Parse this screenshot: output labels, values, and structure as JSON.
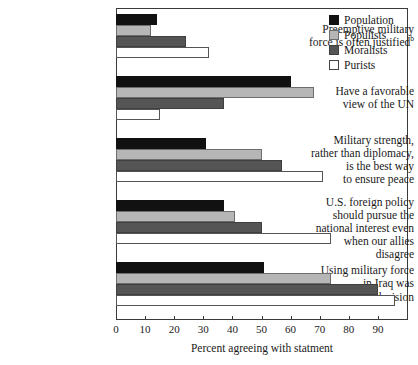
{
  "chart_data": {
    "type": "bar",
    "orientation": "horizontal",
    "title": "",
    "xlabel": "Percent agreeing with statment",
    "ylabel": "",
    "xlim": [
      0,
      100
    ],
    "xticks": [
      0,
      10,
      20,
      30,
      40,
      50,
      60,
      70,
      80,
      90
    ],
    "grid": false,
    "legend_position": "top-right",
    "categories": [
      "Preemptive military force is often justified",
      "Have a favorable view of the UN",
      "Military strength, rather than diplomacy, is the best way to ensure peace",
      "U.S. foreign policy should pursue the national interest even when our allies disagree",
      "Using military force in Iraq was right decision"
    ],
    "series": [
      {
        "name": "Population",
        "color": "#111111",
        "values": [
          14,
          60,
          31,
          37,
          51
        ]
      },
      {
        "name": "Populists",
        "color": "#b6b6b6",
        "values": [
          12,
          68,
          50,
          41,
          74
        ]
      },
      {
        "name": "Moralists",
        "color": "#555555",
        "values": [
          24,
          37,
          57,
          50,
          90
        ]
      },
      {
        "name": "Purists",
        "color": "#ffffff",
        "values": [
          32,
          15,
          71,
          74,
          96
        ]
      }
    ]
  },
  "categories_display": [
    {
      "lines": [
        "Preemptive military",
        "force is often justified"
      ],
      "footnote": "b"
    },
    {
      "lines": [
        "Have a favorable",
        "view of the UN"
      ],
      "footnote": ""
    },
    {
      "lines": [
        "Military strength,",
        "rather than diplomacy,",
        "is the best way",
        "to ensure peace"
      ],
      "footnote": ""
    },
    {
      "lines": [
        "U.S. foreign policy",
        "should pursue the",
        "national interest even",
        "when our allies disagree"
      ],
      "footnote": ""
    },
    {
      "lines": [
        "Using military force",
        "in Iraq was",
        "right decision"
      ],
      "footnote": ""
    }
  ],
  "legend": {
    "items": [
      {
        "label": "Population"
      },
      {
        "label": "Populists"
      },
      {
        "label": "Moralists"
      },
      {
        "label": "Purists"
      }
    ]
  },
  "axis": {
    "x_title": "Percent agreeing with statment",
    "tick_labels": [
      "0",
      "10",
      "20",
      "30",
      "40",
      "50",
      "60",
      "70",
      "80",
      "90"
    ]
  }
}
